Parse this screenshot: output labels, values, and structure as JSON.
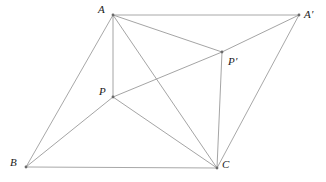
{
  "figure": {
    "kind": "geometry-diagram",
    "background_color": "#ffffff",
    "line_color": "#9a9a9a",
    "label_color": "#1a1a1a",
    "canvas": {
      "width": 326,
      "height": 182
    },
    "points": [
      {
        "id": "A",
        "label": "A",
        "x": 113,
        "y": 15,
        "label_x": 98,
        "label_y": 4
      },
      {
        "id": "Ap",
        "label": "A′",
        "x": 299,
        "y": 15,
        "label_x": 304,
        "label_y": 9
      },
      {
        "id": "B",
        "label": "B",
        "x": 26,
        "y": 167,
        "label_x": 10,
        "label_y": 157
      },
      {
        "id": "C",
        "label": "C",
        "x": 217,
        "y": 168,
        "label_x": 222,
        "label_y": 159
      },
      {
        "id": "P",
        "label": "P",
        "x": 113,
        "y": 97,
        "label_x": 99,
        "label_y": 86
      },
      {
        "id": "Pp",
        "label": "P′",
        "x": 222,
        "y": 52,
        "label_x": 228,
        "label_y": 56
      }
    ],
    "segments": [
      {
        "from": "A",
        "to": "Ap",
        "role": "outer"
      },
      {
        "from": "A",
        "to": "B",
        "role": "outer"
      },
      {
        "from": "B",
        "to": "C",
        "role": "outer"
      },
      {
        "from": "C",
        "to": "Ap",
        "role": "outer"
      },
      {
        "from": "A",
        "to": "P",
        "role": "inner"
      },
      {
        "from": "B",
        "to": "P",
        "role": "inner"
      },
      {
        "from": "P",
        "to": "C",
        "role": "inner"
      },
      {
        "from": "P",
        "to": "Pp",
        "role": "inner"
      },
      {
        "from": "Pp",
        "to": "Ap",
        "role": "inner"
      },
      {
        "from": "Pp",
        "to": "C",
        "role": "inner"
      },
      {
        "from": "A",
        "to": "Pp",
        "role": "inner"
      },
      {
        "from": "A",
        "to": "C",
        "role": "inner"
      }
    ],
    "vertex_markers": [
      "A",
      "Ap",
      "B",
      "C",
      "P",
      "Pp"
    ]
  }
}
